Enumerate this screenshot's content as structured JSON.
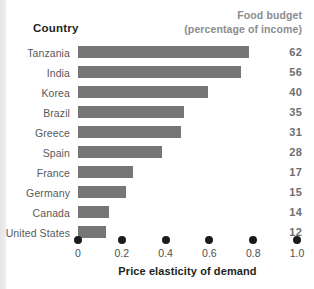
{
  "header": {
    "country_label": "Country",
    "budget_line1": "Food budget",
    "budget_line2": "(percentage of income)"
  },
  "axis": {
    "title": "Price elasticity of demand",
    "ticks": [
      "0",
      "0.2",
      "0.4",
      "0.6",
      "0.8",
      "1.0"
    ]
  },
  "colors": {
    "bar": "#767676",
    "value_text": "#6d6e71",
    "label_text": "#58595b",
    "header_gray": "#8c8c8f",
    "tick_dot": "#1b1b1b",
    "background": "#ffffff"
  },
  "chart_data": {
    "type": "bar",
    "orientation": "horizontal",
    "title": "",
    "xlabel": "Price elasticity of demand",
    "ylabel": "Country",
    "xlim": [
      0,
      1.0
    ],
    "xticks": [
      0,
      0.2,
      0.4,
      0.6,
      0.8,
      1.0
    ],
    "grid": false,
    "legend": false,
    "categories": [
      "Tanzania",
      "India",
      "Korea",
      "Brazil",
      "Greece",
      "Spain",
      "France",
      "Germany",
      "Canada",
      "United States"
    ],
    "values": [
      0.78,
      0.745,
      0.595,
      0.485,
      0.47,
      0.385,
      0.25,
      0.22,
      0.14,
      0.13
    ],
    "annotations": {
      "name": "Food budget (percentage of income)",
      "values": [
        62,
        56,
        40,
        35,
        31,
        28,
        17,
        15,
        14,
        12
      ]
    },
    "rows": [
      {
        "country": "Tanzania",
        "elasticity": 0.78,
        "food_budget": "62"
      },
      {
        "country": "India",
        "elasticity": 0.745,
        "food_budget": "56"
      },
      {
        "country": "Korea",
        "elasticity": 0.595,
        "food_budget": "40"
      },
      {
        "country": "Brazil",
        "elasticity": 0.485,
        "food_budget": "35"
      },
      {
        "country": "Greece",
        "elasticity": 0.47,
        "food_budget": "31"
      },
      {
        "country": "Spain",
        "elasticity": 0.385,
        "food_budget": "28"
      },
      {
        "country": "France",
        "elasticity": 0.25,
        "food_budget": "17"
      },
      {
        "country": "Germany",
        "elasticity": 0.22,
        "food_budget": "15"
      },
      {
        "country": "Canada",
        "elasticity": 0.14,
        "food_budget": "14"
      },
      {
        "country": "United States",
        "elasticity": 0.13,
        "food_budget": "12"
      }
    ]
  }
}
